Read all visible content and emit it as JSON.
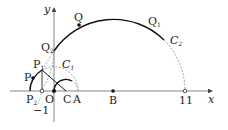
{
  "labels": {
    "y_axis": "y",
    "x_axis": "x",
    "Q": "Q",
    "Q1": "Q",
    "Q1_sub": "1",
    "Q2": "Q",
    "Q2_sub": "2",
    "C1": "C",
    "C1_sub": "1",
    "C2": "C",
    "C2_sub": "2",
    "P": "P",
    "P1": "P",
    "P1_sub": "1",
    "P2": "P",
    "P2_sub": "2",
    "O": "O",
    "C": "C",
    "A": "A",
    "B": "B",
    "eleven": "11",
    "minus_one": "−1"
  }
}
